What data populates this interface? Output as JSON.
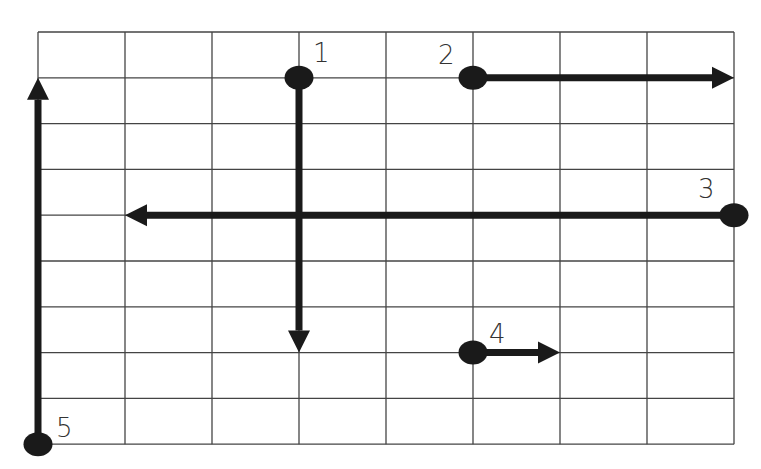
{
  "diagram": {
    "title": "",
    "grid": {
      "columns": 8,
      "rows": 9,
      "left": 38,
      "top": 32,
      "cell_width": 87,
      "cell_height": 45.8,
      "line_color": "#444444"
    },
    "arrow_color": "#1a1a1a",
    "arrows": [
      {
        "label": "1",
        "start": [
          3,
          1
        ],
        "end": [
          3,
          7
        ],
        "direction": "down"
      },
      {
        "label": "2",
        "start": [
          5,
          1
        ],
        "end": [
          8,
          1
        ],
        "direction": "right"
      },
      {
        "label": "3",
        "start": [
          8,
          4
        ],
        "end": [
          1,
          4
        ],
        "direction": "left"
      },
      {
        "label": "4",
        "start": [
          5,
          7
        ],
        "end": [
          6,
          7
        ],
        "direction": "right"
      },
      {
        "label": "5",
        "start": [
          0,
          9
        ],
        "end": [
          0,
          1
        ],
        "direction": "up"
      }
    ]
  },
  "labels": {
    "arrow1": "1",
    "arrow2": "2",
    "arrow3": "3",
    "arrow4": "4",
    "arrow5": "5"
  }
}
